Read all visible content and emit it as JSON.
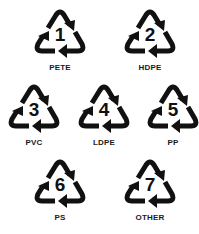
{
  "symbols": [
    {
      "code": "1",
      "label": "PETE",
      "x": 34,
      "y": 8
    },
    {
      "code": "2",
      "label": "HDPE",
      "x": 124,
      "y": 8
    },
    {
      "code": "3",
      "label": "PVC",
      "x": 8,
      "y": 83
    },
    {
      "code": "4",
      "label": "LDPE",
      "x": 78,
      "y": 83
    },
    {
      "code": "5",
      "label": "PP",
      "x": 147,
      "y": 83
    },
    {
      "code": "6",
      "label": "PS",
      "x": 34,
      "y": 158
    },
    {
      "code": "7",
      "label": "OTHER",
      "x": 124,
      "y": 158
    }
  ],
  "icon": "recycling-triangle-icon",
  "colors": {
    "symbol": "#111111",
    "background": "#ffffff"
  }
}
